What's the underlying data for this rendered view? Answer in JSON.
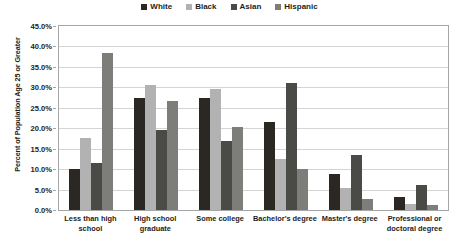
{
  "chart_data": {
    "type": "bar",
    "title": "",
    "xlabel": "",
    "ylabel": "Percent of Population Age 25 or Greater",
    "ylim": [
      0,
      45
    ],
    "ytick_labels": [
      "45.0%",
      "40.0%",
      "35.0%",
      "30.0%",
      "25.0%",
      "20.0%",
      "15.0%",
      "10.0%",
      "5.0%",
      "0.0%"
    ],
    "ytick_values": [
      45,
      40,
      35,
      30,
      25,
      20,
      15,
      10,
      5,
      0
    ],
    "grid": true,
    "legend_position": "top-center",
    "categories": [
      "Less than high school",
      "High school graduate",
      "Some college",
      "Bachelor's degree",
      "Master's degree",
      "Professional or doctoral degree"
    ],
    "category_lines": [
      [
        "Less than high",
        "school"
      ],
      [
        "High school",
        "graduate"
      ],
      [
        "Some college"
      ],
      [
        "Bachelor's degree"
      ],
      [
        "Master's degree"
      ],
      [
        "Professional or",
        "doctoral degree"
      ]
    ],
    "series": [
      {
        "name": "White",
        "color": "#2b2722",
        "values": [
          10.0,
          27.3,
          27.5,
          21.5,
          8.8,
          3.2
        ]
      },
      {
        "name": "Black",
        "color": "#b2b2b2",
        "values": [
          17.7,
          30.6,
          29.7,
          12.5,
          5.5,
          1.4
        ]
      },
      {
        "name": "Asian",
        "color": "#4a4a47",
        "values": [
          11.6,
          19.6,
          16.9,
          31.1,
          13.5,
          6.0
        ]
      },
      {
        "name": "Hispanic",
        "color": "#7d7d7a",
        "values": [
          38.3,
          26.6,
          20.4,
          10.0,
          2.8,
          1.2
        ]
      }
    ]
  }
}
